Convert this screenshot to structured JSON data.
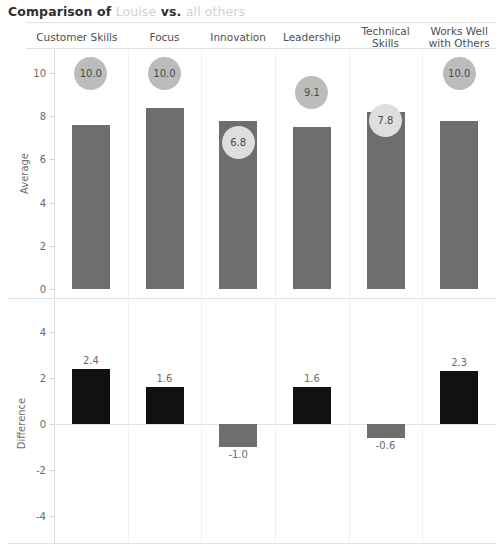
{
  "title": {
    "prefix": "Comparison of ",
    "subject": "Louise",
    "middle": " vs. ",
    "suffix": "all others"
  },
  "columns": [
    "Customer Skills",
    "Focus",
    "Innovation",
    "Leadership",
    "Technical Skills",
    "Works Well with Others"
  ],
  "colors": {
    "bar_average": "#6e6e6e",
    "bar_positive": "#111111",
    "bar_negative": "#6e6e6e",
    "bubble_dark": "#bcbcbc",
    "bubble_light": "#dedede",
    "axis": "#dcdcdc",
    "text": "#6b6b6b",
    "title_dim": "#d2d2d2"
  },
  "chart_data": [
    {
      "type": "bar",
      "title": "Average",
      "ylabel": "Average",
      "xlabel": "",
      "categories": [
        "Customer Skills",
        "Focus",
        "Innovation",
        "Leadership",
        "Technical Skills",
        "Works Well with Others"
      ],
      "values": [
        7.6,
        8.4,
        7.8,
        7.5,
        8.2,
        7.8
      ],
      "point_values": [
        10.0,
        10.0,
        6.8,
        9.1,
        7.8,
        10.0
      ],
      "point_labels": [
        "10.0",
        "10.0",
        "6.8",
        "9.1",
        "7.8",
        "10.0"
      ],
      "yticks": [
        0,
        2,
        4,
        6,
        8,
        10
      ],
      "ytick_labels": [
        "0",
        "2",
        "4",
        "6",
        "8",
        "10"
      ],
      "ylim": [
        0,
        11
      ],
      "grid": false,
      "legend": "none"
    },
    {
      "type": "bar",
      "title": "Difference",
      "ylabel": "Difference",
      "xlabel": "",
      "categories": [
        "Customer Skills",
        "Focus",
        "Innovation",
        "Leadership",
        "Technical Skills",
        "Works Well with Others"
      ],
      "values": [
        2.4,
        1.6,
        -1.0,
        1.6,
        -0.6,
        2.3
      ],
      "value_labels": [
        "2.4",
        "1.6",
        "-1.0",
        "1.6",
        "-0.6",
        "2.3"
      ],
      "yticks": [
        -4,
        -2,
        0,
        2,
        4
      ],
      "ytick_labels": [
        "-4",
        "-2",
        "0",
        "2",
        "4"
      ],
      "ylim": [
        -5,
        5
      ],
      "grid": false,
      "legend": "none"
    }
  ]
}
